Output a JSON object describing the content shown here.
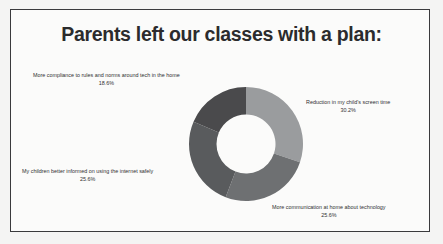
{
  "slide": {
    "title": "Parents left our classes with a plan:",
    "background_color": "#fbfbfa",
    "border_color": "#3a3a3c"
  },
  "chart_data": {
    "type": "pie",
    "variant": "donut",
    "title": "Parents left our classes with a plan:",
    "xlabel": "",
    "ylabel": "",
    "legend_position": "callout-labels",
    "grid": false,
    "start_angle_deg": 0,
    "direction": "clockwise",
    "categories": [
      "Reduction in my child's screen time",
      "More communication at home about technology",
      "My children better informed on using the internet safely",
      "More compliance to rules and norms around tech in the home"
    ],
    "values": [
      30.2,
      25.6,
      25.6,
      18.6
    ],
    "value_labels": [
      "30.2%",
      "25.6%",
      "25.6%",
      "18.6%"
    ],
    "colors": [
      "#9a9c9e",
      "#6e7072",
      "#595b5d",
      "#4a4a4c"
    ],
    "slices": [
      {
        "label": "Reduction in my child's screen time",
        "value": 30.2,
        "value_label": "30.2%",
        "color": "#9a9c9e"
      },
      {
        "label": "More communication at home about technology",
        "value": 25.6,
        "value_label": "25.6%",
        "color": "#6e7072"
      },
      {
        "label": "My children better informed on using the internet safely",
        "value": 25.6,
        "value_label": "25.6%",
        "color": "#595b5d"
      },
      {
        "label": "More compliance to rules and norms around tech in the home",
        "value": 18.6,
        "value_label": "18.6%",
        "color": "#4a4a4c"
      }
    ]
  }
}
